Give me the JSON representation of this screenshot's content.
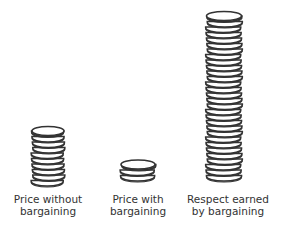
{
  "chart_data": {
    "type": "bar",
    "style": "pictograph-coin-stacks",
    "title": "",
    "xlabel": "",
    "ylabel": "",
    "grid": false,
    "legend": null,
    "categories": [
      "Price without bargaining",
      "Price with bargaining",
      "Respect earned by bargaining"
    ],
    "category_lines": [
      [
        "Price without",
        "bargaining"
      ],
      [
        "Price with",
        "bargaining"
      ],
      [
        "Respect earned",
        "by bargaining"
      ]
    ],
    "values": [
      10,
      3,
      30
    ],
    "value_unit": "coins (relative stack height, estimated)",
    "colors": {
      "stroke": "#333333",
      "fill": "#ffffff",
      "text": "#333333"
    }
  },
  "stacks": [
    {
      "cx": 48,
      "bottom": 186,
      "width": 32,
      "coins": 10
    },
    {
      "cx": 138,
      "bottom": 181,
      "width": 34,
      "coins": 3
    },
    {
      "cx": 224,
      "bottom": 181,
      "width": 35,
      "coins": 30
    }
  ],
  "labels": [
    {
      "x": 48,
      "y": 193,
      "line1": "Price without",
      "line2": "bargaining"
    },
    {
      "x": 138,
      "y": 193,
      "line1": "Price with",
      "line2": "bargaining"
    },
    {
      "x": 228,
      "y": 193,
      "line1": "Respect earned",
      "line2": "by bargaining"
    }
  ]
}
